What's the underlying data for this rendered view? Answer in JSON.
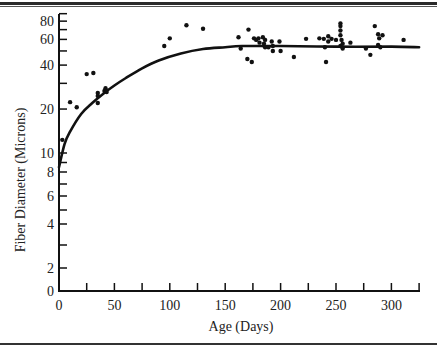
{
  "chart_data": {
    "type": "scatter",
    "title": "",
    "xlabel": "Age (Days)",
    "ylabel": "Fiber Diameter (Microns)",
    "xlim": [
      0,
      325
    ],
    "ylim": [
      0,
      80
    ],
    "y_scale": "log (broken at 0)",
    "x_ticks": [
      0,
      25,
      50,
      75,
      100,
      125,
      150,
      175,
      200,
      225,
      250,
      275,
      300,
      325
    ],
    "x_tick_labels": [
      "0",
      "50",
      "100",
      "150",
      "200",
      "250",
      "300"
    ],
    "x_tick_label_values": [
      0,
      50,
      100,
      150,
      200,
      250,
      300
    ],
    "y_ticks": [
      0,
      2,
      3,
      4,
      5,
      6,
      7,
      8,
      9,
      10,
      20,
      30,
      40,
      50,
      60,
      70,
      80,
      90
    ],
    "y_tick_labels": [
      "0",
      "2",
      "4",
      "6",
      "8",
      "10",
      "20",
      "40",
      "60",
      "80"
    ],
    "y_tick_label_values": [
      0,
      2,
      4,
      6,
      8,
      10,
      20,
      40,
      60,
      80
    ],
    "grid": false,
    "legend": "none",
    "series": [
      {
        "name": "observations",
        "type": "scatter",
        "points": [
          [
            3,
            12.3
          ],
          [
            10,
            22.3
          ],
          [
            16,
            20.6
          ],
          [
            25,
            34.7
          ],
          [
            31,
            35.3
          ],
          [
            35,
            25.8
          ],
          [
            35,
            24.6
          ],
          [
            35,
            22
          ],
          [
            41,
            26.6
          ],
          [
            42,
            27.8
          ],
          [
            43,
            26.2
          ],
          [
            95,
            54
          ],
          [
            100,
            61
          ],
          [
            115,
            75
          ],
          [
            130,
            71
          ],
          [
            162,
            62
          ],
          [
            164,
            52
          ],
          [
            170,
            44
          ],
          [
            171,
            70
          ],
          [
            174,
            42
          ],
          [
            176,
            61
          ],
          [
            178,
            59.5
          ],
          [
            180,
            61
          ],
          [
            181,
            57
          ],
          [
            184,
            62
          ],
          [
            185,
            56
          ],
          [
            186,
            59.5
          ],
          [
            186,
            53
          ],
          [
            189,
            53
          ],
          [
            192,
            58
          ],
          [
            193,
            54
          ],
          [
            193,
            50
          ],
          [
            199,
            58
          ],
          [
            200,
            50
          ],
          [
            212,
            45.5
          ],
          [
            223,
            60.5
          ],
          [
            235,
            61
          ],
          [
            239,
            60.5
          ],
          [
            240,
            53
          ],
          [
            241,
            42
          ],
          [
            243,
            58
          ],
          [
            243,
            63
          ],
          [
            246,
            60.5
          ],
          [
            250,
            59.5
          ],
          [
            254,
            54
          ],
          [
            254,
            77
          ],
          [
            254,
            74
          ],
          [
            254,
            69
          ],
          [
            254,
            64
          ],
          [
            255,
            59.5
          ],
          [
            256,
            56
          ],
          [
            256,
            52
          ],
          [
            263,
            57
          ],
          [
            277,
            52
          ],
          [
            281,
            47
          ],
          [
            285,
            74
          ],
          [
            288,
            65
          ],
          [
            289,
            61
          ],
          [
            292,
            64
          ],
          [
            288,
            55
          ],
          [
            290,
            53
          ],
          [
            311,
            59.5
          ]
        ]
      },
      {
        "name": "fitted-curve",
        "type": "line",
        "x": [
          0,
          5,
          10,
          20,
          30,
          40,
          50,
          60,
          75,
          90,
          110,
          130,
          150,
          165,
          200,
          250,
          300,
          325
        ],
        "y": [
          8.5,
          11.5,
          14,
          18.5,
          22,
          25.5,
          29,
          32.5,
          38,
          43,
          48,
          51.5,
          53,
          54,
          54,
          53.5,
          53.5,
          53
        ]
      }
    ]
  }
}
